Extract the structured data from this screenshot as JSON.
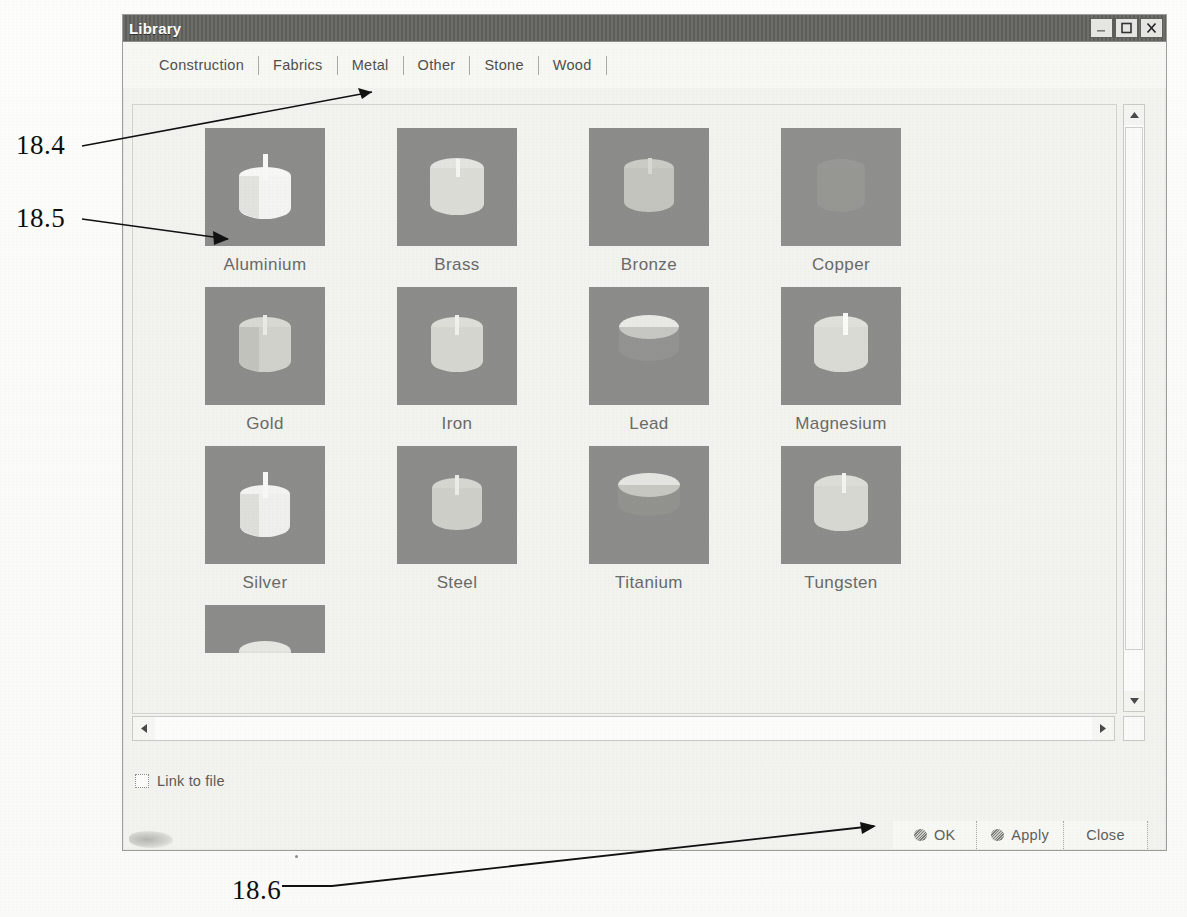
{
  "figure": {
    "callouts": [
      {
        "id": "c1",
        "label": "18.4"
      },
      {
        "id": "c2",
        "label": "18.5"
      },
      {
        "id": "c3",
        "label": "18.6"
      }
    ]
  },
  "window": {
    "title": "Library",
    "controls": {
      "minimize": "minimize-icon",
      "maximize": "maximize-icon",
      "close": "close-icon"
    }
  },
  "tabs": {
    "selected": "Metal",
    "items": [
      {
        "label": "Construction"
      },
      {
        "label": "Fabrics"
      },
      {
        "label": "Metal"
      },
      {
        "label": "Other"
      },
      {
        "label": "Stone"
      },
      {
        "label": "Wood"
      }
    ]
  },
  "library": {
    "rows": [
      [
        {
          "label": "Aluminium",
          "swatch": "#efefec",
          "shape": "cylinder-bright"
        },
        {
          "label": "Brass",
          "swatch": "#dcdcd6",
          "shape": "cylinder"
        },
        {
          "label": "Bronze",
          "swatch": "#c9c9c4",
          "shape": "cylinder-dim"
        },
        {
          "label": "Copper",
          "swatch": "#9a9a97",
          "shape": "cylinder-faint"
        }
      ],
      [
        {
          "label": "Gold",
          "swatch": "#d3d3cd",
          "shape": "cylinder"
        },
        {
          "label": "Iron",
          "swatch": "#d8d8d2",
          "shape": "cylinder"
        },
        {
          "label": "Lead",
          "swatch": "#dededa",
          "shape": "cylinder-top"
        },
        {
          "label": "Magnesium",
          "swatch": "#dcdcd7",
          "shape": "cylinder"
        }
      ],
      [
        {
          "label": "Silver",
          "swatch": "#ececea",
          "shape": "cylinder-bright"
        },
        {
          "label": "Steel",
          "swatch": "#d4d4cf",
          "shape": "cylinder"
        },
        {
          "label": "Titanium",
          "swatch": "#dcdcd8",
          "shape": "cylinder-top"
        },
        {
          "label": "Tungsten",
          "swatch": "#d9d9d4",
          "shape": "cylinder"
        }
      ]
    ],
    "partial_row": [
      {
        "label": "",
        "swatch": "#e4e4e0",
        "shape": "cylinder-clipped"
      }
    ]
  },
  "scrollbars": {
    "vertical": {
      "up": "scroll-up-arrow",
      "down": "scroll-down-arrow",
      "thumb_position": "top"
    },
    "horizontal": {
      "left": "scroll-left-arrow",
      "right": "scroll-right-arrow"
    }
  },
  "options": {
    "link_to_file": {
      "label": "Link to file",
      "checked": false
    }
  },
  "buttons": [
    {
      "label": "OK",
      "has_glyph": true
    },
    {
      "label": "Apply",
      "has_glyph": true
    },
    {
      "label": "Close",
      "has_glyph": false
    }
  ]
}
